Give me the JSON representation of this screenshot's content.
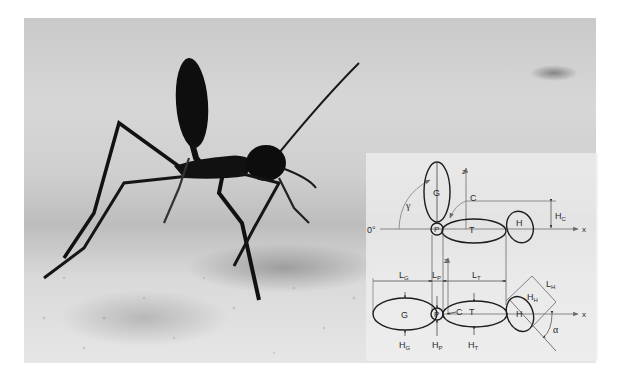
{
  "figure": {
    "photo_subject": "Desert ant (Cataglyphis) standing on sand with gaster raised",
    "background_color": "#d0d0d0",
    "ant_color": "#111111",
    "line_color": "#222222",
    "guide_color": "#7a7a7a"
  },
  "diagram": {
    "top_view": {
      "angle_zero_label": "0°",
      "angle_label": "γ",
      "axis_z_label": "z",
      "axis_x_label": "x",
      "point_c_label": "C",
      "height_c_label": "H",
      "height_c_sub": "C",
      "segments": [
        {
          "id": "gaster",
          "label": "G"
        },
        {
          "id": "petiole",
          "label": "P"
        },
        {
          "id": "thorax",
          "label": "T"
        },
        {
          "id": "head",
          "label": "H"
        }
      ]
    },
    "bottom_view": {
      "axis_z_label": "z",
      "axis_x_label": "x",
      "point_c_label": "C",
      "angle_label": "α",
      "length_labels": [
        {
          "main": "L",
          "sub": "G"
        },
        {
          "main": "L",
          "sub": "P"
        },
        {
          "main": "L",
          "sub": "T"
        },
        {
          "main": "L",
          "sub": "H"
        }
      ],
      "height_labels": [
        {
          "main": "H",
          "sub": "G"
        },
        {
          "main": "H",
          "sub": "P"
        },
        {
          "main": "H",
          "sub": "T"
        },
        {
          "main": "H",
          "sub": "H"
        }
      ],
      "segments": [
        {
          "id": "gaster",
          "label": "G"
        },
        {
          "id": "petiole",
          "label": "P"
        },
        {
          "id": "thorax",
          "label": "T"
        },
        {
          "id": "head",
          "label": "H"
        }
      ]
    }
  }
}
